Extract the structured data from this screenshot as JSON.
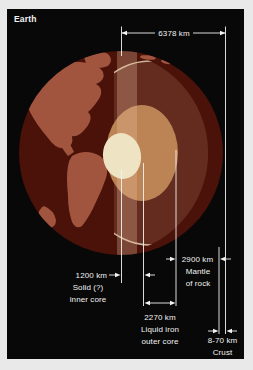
{
  "title": "Earth",
  "colors": {
    "frame": "#e9e9e9",
    "panel": "#080808",
    "ocean": "#4a1208",
    "continent": "#a2553e",
    "mantle": "#632c1f",
    "crust_line": "#cdb79a",
    "cut_face_highlight": "rgba(235,190,160,0.30)",
    "outer_core": "#bc8455",
    "inner_core": "#eee3c3",
    "annotation": "#f2f2f2"
  },
  "annotations": {
    "radius": {
      "value": "6378 km"
    },
    "inner_core": {
      "value": "1200 km",
      "line1": "Solid (?)",
      "line2": "inner core"
    },
    "outer_core": {
      "value": "2270 km",
      "line1": "Liquid iron",
      "line2": "outer core"
    },
    "mantle": {
      "value": "2900 km",
      "line1": "Mantle",
      "line2": "of rock"
    },
    "crust": {
      "value": "8-70 km",
      "line1": "Crust"
    }
  }
}
